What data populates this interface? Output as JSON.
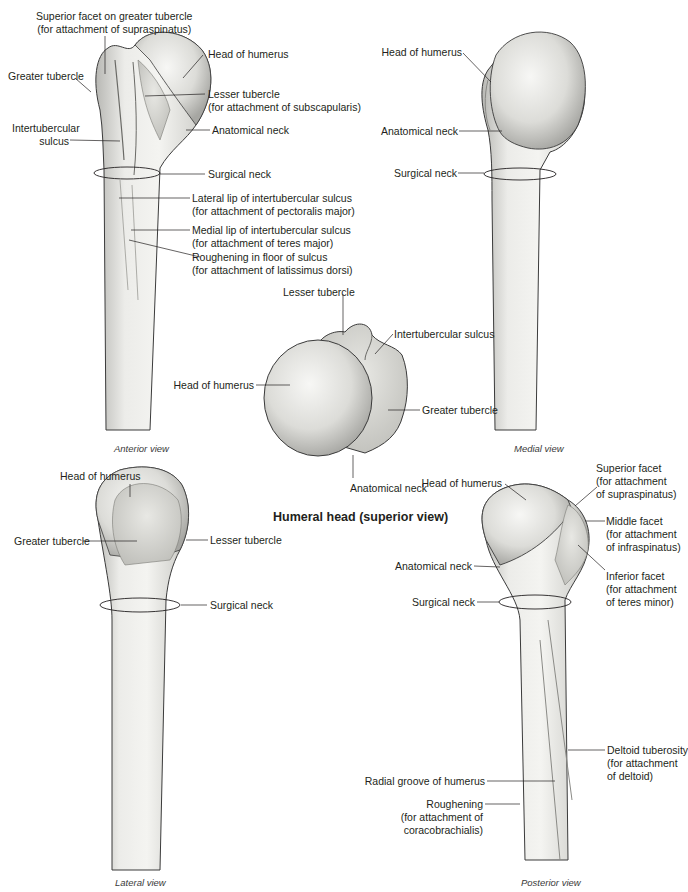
{
  "figure": {
    "views": {
      "anterior": {
        "caption": "Anterior view",
        "labels": {
          "superior_facet": [
            "Superior facet on greater tubercle",
            "(for attachment of supraspinatus)"
          ],
          "head": "Head of humerus",
          "greater_tubercle": "Greater tubercle",
          "lesser_tubercle": [
            "Lesser tubercle",
            "(for attachment of subscapularis)"
          ],
          "intertubercular_sulcus": [
            "Intertubercular",
            "sulcus"
          ],
          "anatomical_neck": "Anatomical neck",
          "surgical_neck": "Surgical neck",
          "lateral_lip": [
            "Lateral lip of intertubercular sulcus",
            "(for attachment of pectoralis major)"
          ],
          "medial_lip": [
            "Medial lip of intertubercular sulcus",
            "(for attachment of teres major)"
          ],
          "roughening": [
            "Roughening in floor of sulcus",
            "(for attachment of latissimus dorsi)"
          ]
        }
      },
      "medial": {
        "caption": "Medial view",
        "labels": {
          "head": "Head of humerus",
          "anatomical_neck": "Anatomical neck",
          "surgical_neck": "Surgical neck"
        }
      },
      "superior": {
        "title": "Humeral head (superior view)",
        "labels": {
          "lesser_tubercle": "Lesser tubercle",
          "intertubercular_sulcus": "Intertubercular sulcus",
          "head": "Head of humerus",
          "greater_tubercle": "Greater tubercle",
          "anatomical_neck": "Anatomical neck"
        }
      },
      "lateral": {
        "caption": "Lateral view",
        "labels": {
          "head": "Head of humerus",
          "greater_tubercle": "Greater tubercle",
          "lesser_tubercle": "Lesser tubercle",
          "surgical_neck": "Surgical neck"
        }
      },
      "posterior": {
        "caption": "Posterior view",
        "labels": {
          "head": "Head of humerus",
          "superior_facet": [
            "Superior facet",
            "(for attachment",
            "of supraspinatus)"
          ],
          "middle_facet": [
            "Middle facet",
            "(for attachment",
            "of infraspinatus)"
          ],
          "inferior_facet": [
            "Inferior facet",
            "(for attachment",
            "of teres minor)"
          ],
          "anatomical_neck": "Anatomical neck",
          "surgical_neck": "Surgical neck",
          "deltoid_tuberosity": [
            "Deltoid tuberosity",
            "(for attachment",
            "of deltoid)"
          ],
          "radial_groove": "Radial groove of humerus",
          "roughening": [
            "Roughening",
            "(for attachment of",
            "coracobrachialis)"
          ]
        }
      }
    },
    "colors": {
      "bone_light": "#f1f1ee",
      "bone_mid": "#d9d9d5",
      "bone_dark": "#a9a9a5",
      "outline": "#3b3b3b",
      "leader": "#231f20"
    }
  }
}
